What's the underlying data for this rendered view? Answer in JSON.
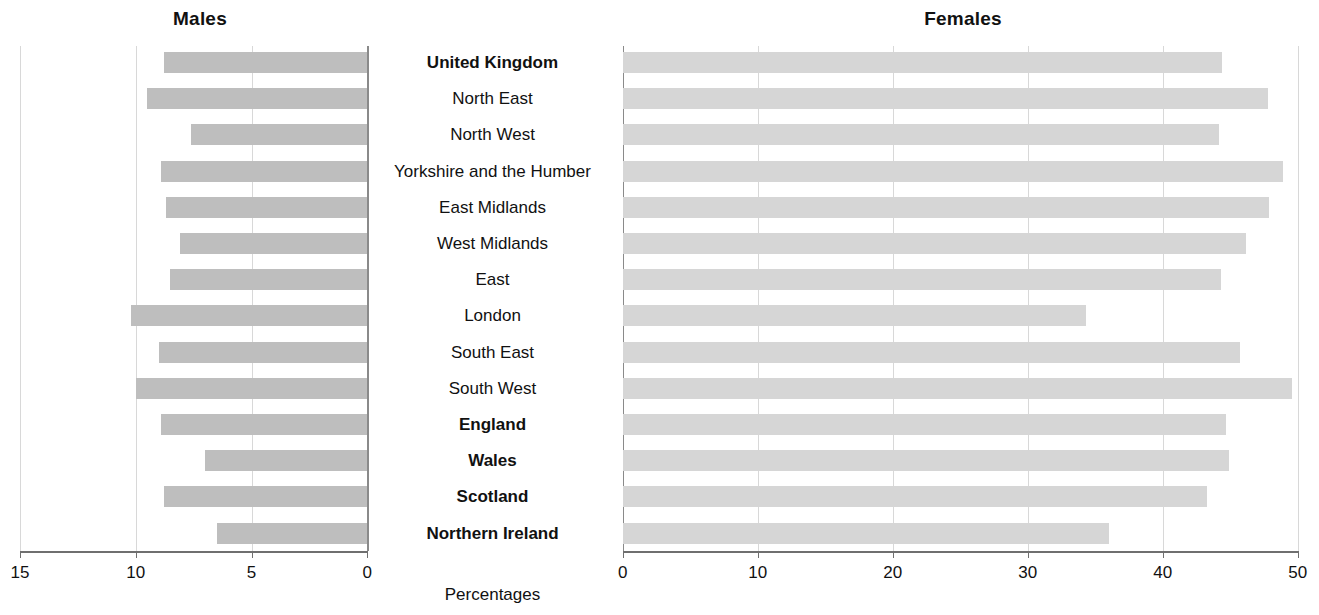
{
  "panels": {
    "left_title": "Males",
    "right_title": "Females",
    "axis_caption": "Percentages"
  },
  "axes": {
    "left_ticks": [
      "15",
      "10",
      "5",
      "0"
    ],
    "right_ticks": [
      "0",
      "10",
      "20",
      "30",
      "40",
      "50"
    ],
    "left_min": 0,
    "left_max": 15,
    "right_min": 0,
    "right_max": 50
  },
  "colors": {
    "male_bar": "#bebebe",
    "female_bar": "#d6d6d6",
    "gridline": "#d8d8d8",
    "axis": "#6f6f6f",
    "text": "#111111"
  },
  "chart_data": {
    "type": "bar",
    "title": "",
    "orientation": "horizontal",
    "layout": "bidirectional population pyramid (back-to-back bars)",
    "xlabel": "Percentages",
    "ylabel": "",
    "grid": true,
    "legend": "none",
    "categories": [
      "United Kingdom",
      "North East",
      "North West",
      "Yorkshire and the Humber",
      "East Midlands",
      "West Midlands",
      "East",
      "London",
      "South East",
      "South West",
      "England",
      "Wales",
      "Scotland",
      "Northern Ireland"
    ],
    "category_emphasis": [
      true,
      false,
      false,
      false,
      false,
      false,
      false,
      false,
      false,
      false,
      true,
      true,
      true,
      true
    ],
    "series": [
      {
        "name": "Males",
        "axis": "left",
        "direction": "left",
        "xlim": [
          0,
          15
        ],
        "ticks": [
          15,
          10,
          5,
          0
        ],
        "values": [
          8.8,
          9.5,
          7.6,
          8.9,
          8.7,
          8.1,
          8.5,
          10.2,
          9.0,
          10.0,
          8.9,
          7.0,
          8.8,
          6.5
        ]
      },
      {
        "name": "Females",
        "axis": "right",
        "direction": "right",
        "xlim": [
          0,
          50
        ],
        "ticks": [
          0,
          10,
          20,
          30,
          40,
          50
        ],
        "values": [
          44.4,
          47.8,
          44.2,
          48.9,
          47.9,
          46.2,
          44.3,
          34.3,
          45.7,
          49.6,
          44.7,
          44.9,
          43.3,
          36.0
        ]
      }
    ]
  }
}
